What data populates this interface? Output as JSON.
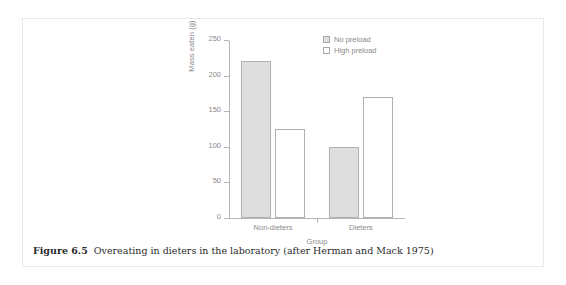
{
  "caption": {
    "number": "Figure 6.5",
    "text": "Overeating in dieters in the laboratory (after Herman and Mack 1975)"
  },
  "colors": {
    "bar_fill": "#dedede",
    "bar_stroke": "#b0b0b0",
    "axis": "#b6b6b6",
    "axis_text": "#8a8a8a",
    "caption_text": "#2b2b2b",
    "panel_border": "#e8e8e8"
  },
  "chart_data": {
    "type": "bar",
    "title": "",
    "xlabel": "Group",
    "ylabel": "Mass eaten (g)",
    "categories": [
      "Non-dieters",
      "Dieters"
    ],
    "series": [
      {
        "name": "No preload",
        "values": [
          220,
          100
        ],
        "style": "filled"
      },
      {
        "name": "High preload",
        "values": [
          125,
          170
        ],
        "style": "open"
      }
    ],
    "ylim": [
      0,
      250
    ],
    "yticks": [
      0,
      50,
      100,
      150,
      200,
      250
    ],
    "ytick_labels": [
      "0",
      "50",
      "100",
      "150",
      "200",
      "250"
    ],
    "grid": false,
    "legend_position": "top-right"
  }
}
